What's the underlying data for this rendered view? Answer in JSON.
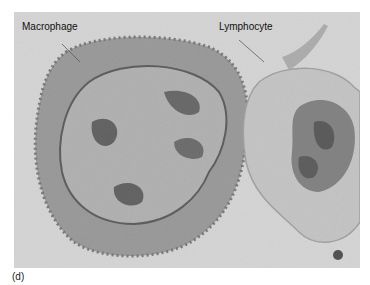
{
  "figure": {
    "panel_label": "(d)",
    "labels": {
      "macrophage": "Macrophage",
      "lymphocyte": "Lymphocyte"
    },
    "colors": {
      "background": "#d4d4d4",
      "cytoplasm_macrophage": "#8a8a8a",
      "cytoplasm_lymphocyte": "#b8b8b8",
      "nucleus": "#6a6a6a",
      "chromatin": "#2a2a2a"
    }
  }
}
